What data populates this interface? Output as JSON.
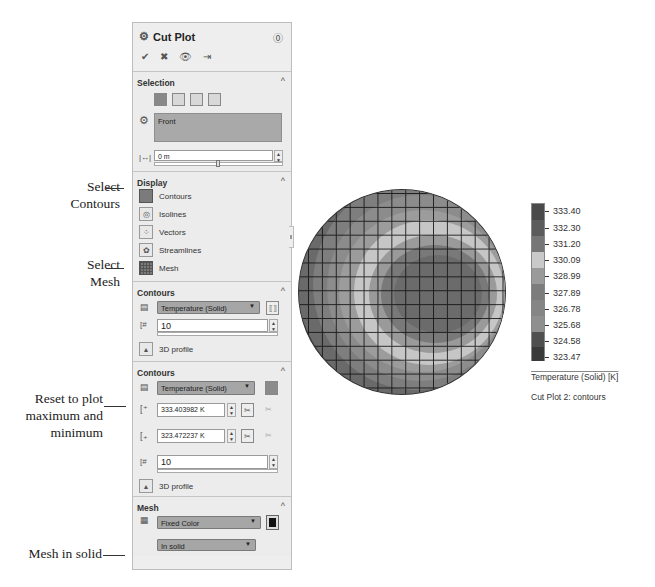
{
  "callouts": {
    "select_contours": [
      "Select",
      "Contours"
    ],
    "select_mesh": [
      "Select",
      "Mesh"
    ],
    "reset": [
      "Reset to plot",
      "maximum and",
      "minimum"
    ],
    "mesh_in_solid": "Mesh in solid"
  },
  "panel": {
    "title": "Cut Plot",
    "icons": {
      "title": "cut-plot-icon",
      "help": "help-icon",
      "ok": "checkmark-icon",
      "cancel": "close-icon",
      "preview": "eye-icon",
      "pin": "pushpin-icon"
    },
    "selection": {
      "title": "Selection",
      "plane_buttons": [
        "front-plane",
        "top-plane",
        "right-plane",
        "custom-plane"
      ],
      "plane_value": "Front",
      "offset_value": "0 m"
    },
    "display": {
      "title": "Display",
      "items": [
        {
          "label": "Contours",
          "icon": "contours-icon",
          "active": true
        },
        {
          "label": "Isolines",
          "icon": "isolines-icon",
          "active": false
        },
        {
          "label": "Vectors",
          "icon": "vectors-icon",
          "active": false
        },
        {
          "label": "Streamlines",
          "icon": "streamlines-icon",
          "active": false
        },
        {
          "label": "Mesh",
          "icon": "mesh-icon",
          "active": true
        }
      ]
    },
    "contours_collapsed": {
      "title": "Contours",
      "parameter": "Temperature (Solid)",
      "levels": "10",
      "profile_label": "3D profile"
    },
    "contours_expanded": {
      "title": "Contours",
      "parameter": "Temperature (Solid)",
      "max_value": "333.403982 K",
      "min_value": "323.472237 K",
      "levels": "10",
      "profile_label": "3D profile"
    },
    "mesh": {
      "title": "Mesh",
      "color_mode": "Fixed Color",
      "color": "#111111",
      "location": "In solid"
    }
  },
  "legend": {
    "values": [
      "333.40",
      "332.30",
      "331.20",
      "330.09",
      "328.99",
      "327.89",
      "326.78",
      "325.68",
      "324.58",
      "323.47"
    ],
    "colors": [
      "#4a4a4a",
      "#5c5c5c",
      "#767676",
      "#c9c9c9",
      "#9a9a9a",
      "#7c7c7c",
      "#858585",
      "#8f8f8f",
      "#4f4f4f",
      "#3a3a3a"
    ],
    "title": "Temperature (Solid) [K]",
    "caption": "Cut Plot 2: contours"
  }
}
